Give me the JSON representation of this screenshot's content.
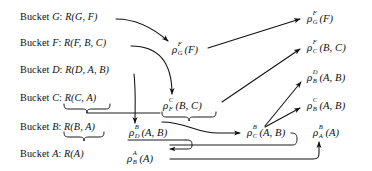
{
  "figure": {
    "type": "bucket-elimination-diagram",
    "background_color": "#ffffff",
    "ink_color": "#101010",
    "width": 372,
    "height": 171
  },
  "buckets": [
    {
      "id": "bucket-g",
      "prefix": "Bucket",
      "name": "G",
      "colon": ":",
      "relation": "R(G, F)",
      "x": 20,
      "y": 18
    },
    {
      "id": "bucket-f",
      "prefix": "Bucket",
      "name": "F",
      "colon": ":",
      "relation": "R(F, B, C)",
      "x": 20,
      "y": 44
    },
    {
      "id": "bucket-d",
      "prefix": "Bucket",
      "name": "D",
      "colon": ":",
      "relation": "R(D, A, B)",
      "x": 20,
      "y": 71
    },
    {
      "id": "bucket-c",
      "prefix": "Bucket",
      "name": "C",
      "colon": ":",
      "relation": "R(C, A)",
      "x": 20,
      "y": 99
    },
    {
      "id": "bucket-b",
      "prefix": "Bucket",
      "name": "B",
      "colon": ":",
      "relation": "R(B, A)",
      "x": 20,
      "y": 128
    },
    {
      "id": "bucket-a",
      "prefix": "Bucket",
      "name": "A",
      "colon": ":",
      "relation": "R(A)",
      "x": 20,
      "y": 155
    }
  ],
  "messages": [
    {
      "id": "rho-g-f-mid",
      "glyph": "ρ",
      "sub": "G",
      "sup": "F",
      "args": "(F)",
      "x": 172,
      "y": 50,
      "text": "ρ_G^F(F)"
    },
    {
      "id": "rho-f-c-mid",
      "glyph": "ρ",
      "sub": "F",
      "sup": "C",
      "args": "(B, C)",
      "x": 163,
      "y": 106,
      "text": "ρ_F^C(B, C)"
    },
    {
      "id": "rho-d-b-mid",
      "glyph": "ρ",
      "sub": "D",
      "sup": "B",
      "args": "(A, B)",
      "x": 129,
      "y": 133,
      "text": "ρ_D^B(A, B)"
    },
    {
      "id": "rho-b-a-bottom",
      "glyph": "ρ",
      "sub": "B",
      "sup": "A",
      "args": "(A)",
      "x": 127,
      "y": 159,
      "text": "ρ_B^A(A)"
    },
    {
      "id": "rho-c-b-mid",
      "glyph": "ρ",
      "sub": "C",
      "sup": "B",
      "args": "(A, B)",
      "x": 247,
      "y": 133,
      "text": "ρ_C^B(A, B)"
    },
    {
      "id": "rho-a-b-right",
      "glyph": "ρ",
      "sub": "A",
      "sup": "B",
      "args": "(A)",
      "x": 313,
      "y": 133,
      "text": "ρ_A^B(A)"
    },
    {
      "id": "rho-g-f-right",
      "glyph": "ρ",
      "sub": "G",
      "sup": "F",
      "args": "(F)",
      "x": 307,
      "y": 19,
      "text": "ρ_G^F(F)"
    },
    {
      "id": "rho-c-f-right",
      "glyph": "ρ",
      "sub": "C",
      "sup": "F",
      "args": "(B, C)",
      "x": 307,
      "y": 48,
      "text": "ρ_C^F(B, C)"
    },
    {
      "id": "rho-b-d-right",
      "glyph": "ρ",
      "sub": "B",
      "sup": "D",
      "args": "(A, B)",
      "x": 307,
      "y": 78,
      "text": "ρ_B^D(A, B)"
    },
    {
      "id": "rho-b-c-right",
      "glyph": "ρ",
      "sub": "B",
      "sup": "C",
      "args": "(A, B)",
      "x": 307,
      "y": 106,
      "text": "ρ_B^C(A, B)"
    }
  ],
  "edges": [
    {
      "id": "edge-bucketG-to-rhoGF",
      "from": "bucket-g",
      "to": "rho-g-f-mid"
    },
    {
      "id": "edge-rhoGF-to-rhoGFright",
      "from": "rho-g-f-mid",
      "to": "rho-g-f-right"
    },
    {
      "id": "edge-bucketF-to-rhoFC",
      "from": "bucket-f",
      "to": "rho-f-c-mid"
    },
    {
      "id": "edge-bucketD-to-rhoDB",
      "from": "bucket-d",
      "to": "rho-d-b-mid"
    },
    {
      "id": "edge-rhoFC-to-rhoCFright",
      "from": "rho-f-c-mid",
      "to": "rho-c-f-right"
    },
    {
      "id": "edge-braceC-to-rhoCB",
      "from": "brace-bucket-c",
      "to": "rho-c-b-mid"
    },
    {
      "id": "edge-braceB-to-rhoBA",
      "from": "brace-bucket-b",
      "to": "rho-b-a-bottom"
    },
    {
      "id": "edge-rhoCB-to-rhoBDright",
      "from": "rho-c-b-mid",
      "to": "rho-b-d-right"
    },
    {
      "id": "edge-rhoCB-to-rhoBCright",
      "from": "rho-c-b-mid",
      "to": "rho-b-c-right"
    },
    {
      "id": "edge-rhoBA-to-rhoABright",
      "from": "rho-b-a-bottom",
      "to": "rho-a-b-right"
    }
  ],
  "braces": [
    {
      "id": "brace-bucket-c",
      "under": "R(C, A)"
    },
    {
      "id": "brace-bucket-b",
      "under": "R(B, A)"
    },
    {
      "id": "brace-rho-fc",
      "under": "ρ_F^C(B, C)"
    },
    {
      "id": "brace-rho-cb",
      "under": "ρ_C^B(A, B)"
    }
  ]
}
